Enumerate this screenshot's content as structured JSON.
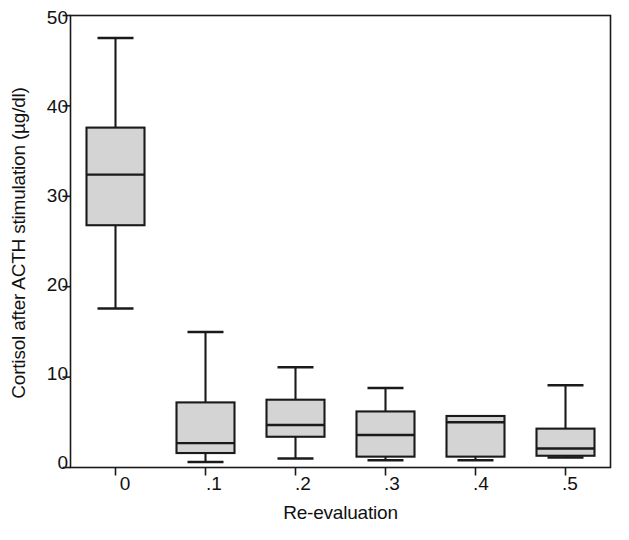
{
  "chart_data": {
    "type": "box",
    "title": "",
    "xlabel": "Re-evaluation",
    "ylabel": "Cortisol after ACTH stimulation (µg/dl)",
    "categories": [
      "0",
      ".1",
      ".2",
      ".3",
      ".4",
      ".5"
    ],
    "ylim": [
      0,
      50
    ],
    "yticks": [
      0,
      10,
      20,
      30,
      40,
      50
    ],
    "ytick_labels": [
      "0",
      "10",
      "20",
      "30",
      "40",
      "50"
    ],
    "grid": false,
    "legend": null,
    "box_fill_color": "#d4d4d4",
    "box_line_color": "#1a1a1a",
    "axis_color": "#1a1a1a",
    "background_color": "#ffffff",
    "boxes": [
      {
        "category": "0",
        "whisker_low": 17.6,
        "q1": 26.8,
        "median": 32.4,
        "q3": 37.6,
        "whisker_high": 47.5
      },
      {
        "category": ".1",
        "whisker_low": 0.6,
        "q1": 1.6,
        "median": 2.7,
        "q3": 7.2,
        "whisker_high": 15.0
      },
      {
        "category": ".2",
        "whisker_low": 1.0,
        "q1": 3.4,
        "median": 4.7,
        "q3": 7.5,
        "whisker_high": 11.1
      },
      {
        "category": ".3",
        "whisker_low": 0.8,
        "q1": 1.2,
        "median": 3.6,
        "q3": 6.2,
        "whisker_high": 8.8
      },
      {
        "category": ".4",
        "whisker_low": 0.8,
        "q1": 1.2,
        "median": 5.0,
        "q3": 5.7,
        "whisker_high": 5.7
      },
      {
        "category": ".5",
        "whisker_low": 1.1,
        "q1": 1.3,
        "median": 2.1,
        "q3": 4.3,
        "whisker_high": 9.1
      }
    ]
  },
  "axis": {
    "ylabel": "Cortisol after ACTH stimulation (µg/dl)",
    "xlabel": "Re-evaluation",
    "ytick_0": "0",
    "ytick_1": "10",
    "ytick_2": "20",
    "ytick_3": "30",
    "ytick_4": "40",
    "ytick_5": "50",
    "xtick_0": "0",
    "xtick_1": ".1",
    "xtick_2": ".2",
    "xtick_3": ".3",
    "xtick_4": ".4",
    "xtick_5": ".5"
  }
}
